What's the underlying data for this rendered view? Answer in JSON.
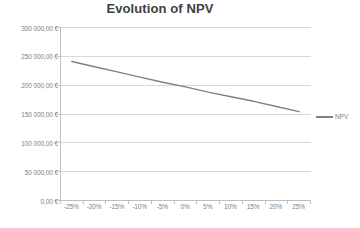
{
  "chart_data": {
    "type": "line",
    "title": "Evolution of NPV",
    "xlabel": "",
    "ylabel": "",
    "categories": [
      "-25%",
      "-20%",
      "-15%",
      "-10%",
      "-5%",
      "0%",
      "5%",
      "10%",
      "15%",
      "20%",
      "25%"
    ],
    "series": [
      {
        "name": "NPV",
        "color": "#808080",
        "values": [
          241000,
          232000,
          223000,
          214000,
          205000,
          197000,
          188000,
          180000,
          172000,
          163000,
          154000
        ]
      }
    ],
    "ylim": [
      0,
      300000
    ],
    "ytick_values": [
      0,
      50000,
      100000,
      150000,
      200000,
      250000,
      300000
    ],
    "ytick_labels": [
      "0,00 €",
      "50 000,00 €",
      "100 000,00 €",
      "150 000,00 €",
      "200 000,00 €",
      "250 000,00 €",
      "300 000,00 €"
    ],
    "grid": true,
    "grid_color": "#d9d9d9",
    "axis_color": "#bfbfbf",
    "legend_position": "right",
    "legend_entries": [
      "NPV"
    ]
  },
  "legend": {
    "npv_label": "NPV"
  },
  "colors": {
    "line": "#808080",
    "grid": "#d9d9d9",
    "axis": "#bfbfbf",
    "title": "#404040",
    "tick_text": "#808080"
  }
}
